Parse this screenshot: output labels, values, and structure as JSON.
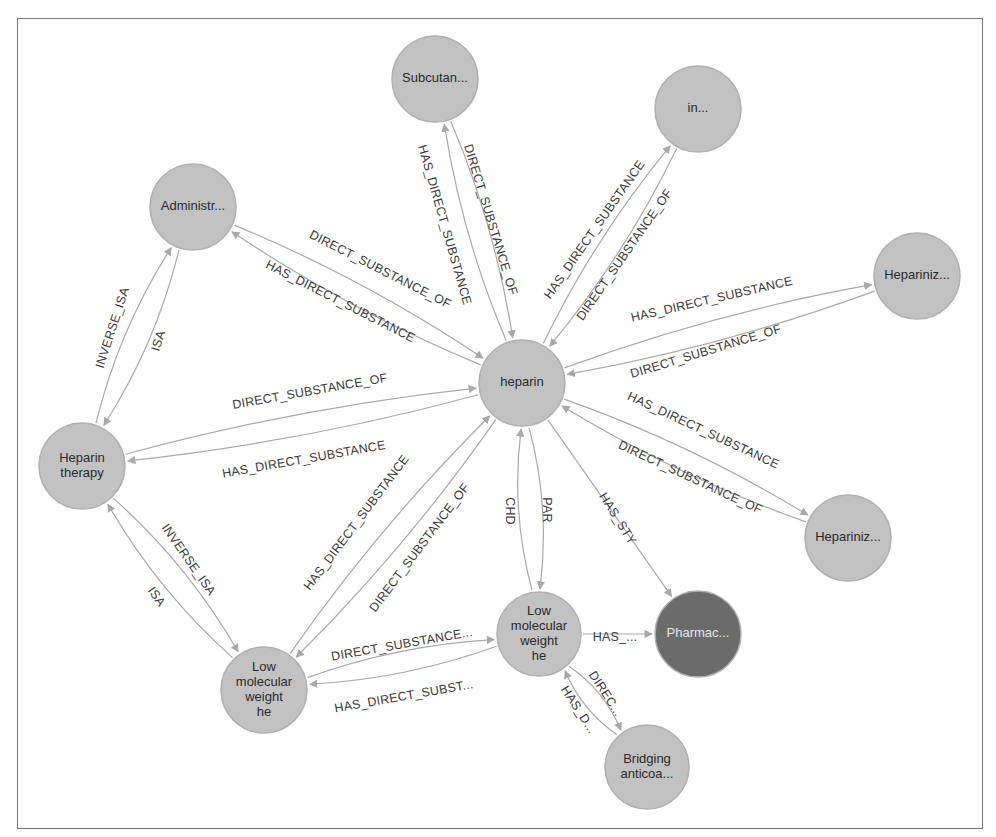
{
  "graph": {
    "colors": {
      "node_default": "#c2c2c2",
      "node_highlight": "#6b6b6b",
      "edge": "#a9a9a9",
      "label_text": "#3a3a3a",
      "frame_border": "#7a7a7a"
    },
    "nodes": [
      {
        "id": "heparin",
        "label": [
          "heparin"
        ],
        "x": 522,
        "y": 383,
        "r": 43,
        "style": "default"
      },
      {
        "id": "subcutan",
        "label": [
          "Subcutan..."
        ],
        "x": 435,
        "y": 79,
        "r": 43,
        "style": "default"
      },
      {
        "id": "in",
        "label": [
          "in..."
        ],
        "x": 698,
        "y": 109,
        "r": 43,
        "style": "default"
      },
      {
        "id": "administr",
        "label": [
          "Administr..."
        ],
        "x": 193,
        "y": 207,
        "r": 43,
        "style": "default"
      },
      {
        "id": "hepariniz_top",
        "label": [
          "Hepariniz..."
        ],
        "x": 917,
        "y": 276,
        "r": 43,
        "style": "default"
      },
      {
        "id": "heparin_therapy",
        "label": [
          "Heparin",
          "therapy"
        ],
        "x": 82,
        "y": 466,
        "r": 43,
        "style": "default"
      },
      {
        "id": "hepariniz_bottom",
        "label": [
          "Hepariniz..."
        ],
        "x": 848,
        "y": 538,
        "r": 43,
        "style": "default"
      },
      {
        "id": "lmw_right",
        "label": [
          "Low",
          "molecular",
          "weight",
          "he"
        ],
        "x": 539,
        "y": 634,
        "r": 42,
        "style": "default"
      },
      {
        "id": "pharmac",
        "label": [
          "Pharmac..."
        ],
        "x": 698,
        "y": 634,
        "r": 43,
        "style": "highlight"
      },
      {
        "id": "lmw_left",
        "label": [
          "Low",
          "molecular",
          "weight",
          "he"
        ],
        "x": 264,
        "y": 690,
        "r": 43,
        "style": "default"
      },
      {
        "id": "bridging",
        "label": [
          "Bridging",
          "anticoa..."
        ],
        "x": 647,
        "y": 767,
        "r": 42,
        "style": "default"
      }
    ],
    "edges": [
      {
        "from": "heparin",
        "to": "subcutan",
        "label": "DIRECT_SUBSTANCE_OF",
        "curve": -14,
        "lx": 490,
        "ly": 220,
        "angle": 73
      },
      {
        "from": "subcutan",
        "to": "heparin",
        "label": "HAS_DIRECT_SUBSTANCE",
        "curve": -14,
        "lx": 444,
        "ly": 225,
        "angle": 74
      },
      {
        "from": "in",
        "to": "heparin",
        "label": "HAS_DIRECT_SUBSTANCE",
        "curve": -14,
        "lx": 595,
        "ly": 230,
        "angle": -55
      },
      {
        "from": "heparin",
        "to": "in",
        "label": "DIRECT_SUBSTANCE_OF",
        "curve": -14,
        "lx": 625,
        "ly": 255,
        "angle": -55
      },
      {
        "from": "heparin",
        "to": "administr",
        "label": "DIRECT_SUBSTANCE_OF",
        "curve": -14,
        "lx": 380,
        "ly": 270,
        "angle": 27
      },
      {
        "from": "administr",
        "to": "heparin",
        "label": "HAS_DIRECT_SUBSTANCE",
        "curve": -14,
        "lx": 340,
        "ly": 302,
        "angle": 27
      },
      {
        "from": "hepariniz_top",
        "to": "heparin",
        "label": "HAS_DIRECT_SUBSTANCE",
        "curve": -14,
        "lx": 712,
        "ly": 300,
        "angle": -13
      },
      {
        "from": "heparin",
        "to": "hepariniz_top",
        "label": "DIRECT_SUBSTANCE_OF",
        "curve": -14,
        "lx": 706,
        "ly": 352,
        "angle": -17
      },
      {
        "from": "heparin",
        "to": "heparin_therapy",
        "label": "DIRECT_SUBSTANCE_OF",
        "curve": -14,
        "lx": 310,
        "ly": 392,
        "angle": -10
      },
      {
        "from": "heparin_therapy",
        "to": "heparin",
        "label": "HAS_DIRECT_SUBSTANCE",
        "curve": -14,
        "lx": 304,
        "ly": 460,
        "angle": -10
      },
      {
        "from": "hepariniz_bottom",
        "to": "heparin",
        "label": "HAS_DIRECT_SUBSTANCE",
        "curve": -14,
        "lx": 703,
        "ly": 431,
        "angle": 25
      },
      {
        "from": "heparin",
        "to": "hepariniz_bottom",
        "label": "DIRECT_SUBSTANCE_OF",
        "curve": -14,
        "lx": 690,
        "ly": 478,
        "angle": 25
      },
      {
        "from": "lmw_left",
        "to": "heparin",
        "label": "HAS_DIRECT_SUBSTANCE",
        "curve": -14,
        "lx": 357,
        "ly": 523,
        "angle": -53
      },
      {
        "from": "heparin",
        "to": "lmw_left",
        "label": "DIRECT_SUBSTANCE_OF",
        "curve": -14,
        "lx": 420,
        "ly": 548,
        "angle": -53
      },
      {
        "from": "lmw_right",
        "to": "heparin",
        "label": "CHD",
        "curve": -16,
        "lx": 509,
        "ly": 511,
        "angle": 90
      },
      {
        "from": "heparin",
        "to": "lmw_right",
        "label": "PAR",
        "curve": -16,
        "lx": 546,
        "ly": 510,
        "angle": 90
      },
      {
        "from": "heparin",
        "to": "pharmac",
        "label": "HAS_STY",
        "curve": 0,
        "lx": 617,
        "ly": 519,
        "angle": 58
      },
      {
        "from": "administr",
        "to": "heparin_therapy",
        "label": "ISA",
        "curve": -16,
        "lx": 159,
        "ly": 341,
        "angle": -72
      },
      {
        "from": "heparin_therapy",
        "to": "administr",
        "label": "INVERSE_ISA",
        "curve": -16,
        "lx": 113,
        "ly": 328,
        "angle": -72
      },
      {
        "from": "heparin_therapy",
        "to": "lmw_left",
        "label": "INVERSE_ISA",
        "curve": -16,
        "lx": 188,
        "ly": 560,
        "angle": 55
      },
      {
        "from": "lmw_left",
        "to": "heparin_therapy",
        "label": "ISA",
        "curve": -16,
        "lx": 156,
        "ly": 597,
        "angle": 55
      },
      {
        "from": "lmw_right",
        "to": "lmw_left",
        "label": "DIRECT_SUBSTANCE...",
        "curve": -14,
        "lx": 402,
        "ly": 645,
        "angle": -10
      },
      {
        "from": "lmw_left",
        "to": "lmw_right",
        "label": "HAS_DIRECT_SUBST...",
        "curve": -14,
        "lx": 404,
        "ly": 697,
        "angle": -10
      },
      {
        "from": "lmw_right",
        "to": "pharmac",
        "label": "HAS_...",
        "curve": 0,
        "lx": 615,
        "ly": 638,
        "angle": 0
      },
      {
        "from": "lmw_right",
        "to": "bridging",
        "label": "DIREC...",
        "curve": -12,
        "lx": 605,
        "ly": 694,
        "angle": 57
      },
      {
        "from": "bridging",
        "to": "lmw_right",
        "label": "HAS_D...",
        "curve": -12,
        "lx": 578,
        "ly": 710,
        "angle": 57
      }
    ]
  }
}
